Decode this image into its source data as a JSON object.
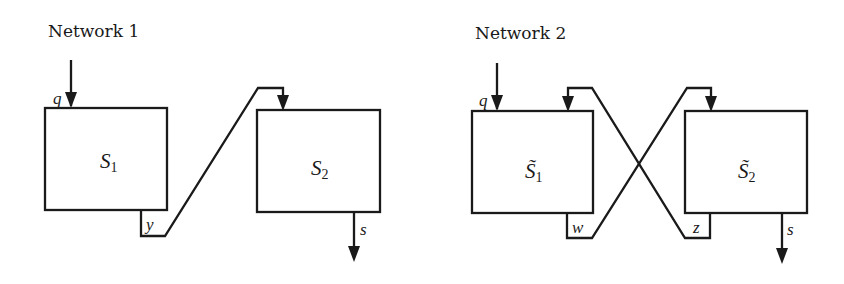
{
  "networks": [
    {
      "title": "Network 1",
      "input_label": "q",
      "blocks": [
        {
          "name": "S",
          "subscript": "1",
          "tilde": false
        },
        {
          "name": "S",
          "subscript": "2",
          "tilde": false
        }
      ],
      "internal_labels": [
        "y"
      ],
      "output_label": "s"
    },
    {
      "title": "Network 2",
      "input_label": "q",
      "blocks": [
        {
          "name": "S̃",
          "subscript": "1",
          "tilde": true
        },
        {
          "name": "S̃",
          "subscript": "2",
          "tilde": true
        }
      ],
      "internal_labels": [
        "w",
        "z"
      ],
      "output_label": "s"
    }
  ],
  "colors": {
    "ink": "#1a1a1a",
    "background": "#ffffff"
  }
}
